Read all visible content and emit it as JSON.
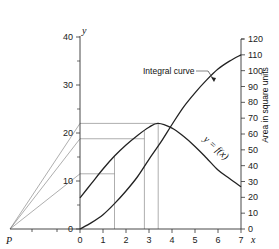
{
  "chart_data": {
    "type": "line",
    "title": "",
    "xlabel": "x",
    "ylabel_left": "y",
    "ylabel_right": "Area in square units",
    "x_ticks": [
      0,
      1,
      2,
      3,
      4,
      5,
      6,
      7
    ],
    "y_left_ticks": [
      0,
      10,
      20,
      30,
      40
    ],
    "y_right_ticks": [
      0,
      10,
      20,
      30,
      40,
      50,
      60,
      70,
      80,
      90,
      100,
      110,
      120
    ],
    "xlim": [
      0,
      7
    ],
    "ylim_left": [
      0,
      40
    ],
    "ylim_right": [
      0,
      120
    ],
    "pole_label": "P",
    "series": [
      {
        "name": "y = f(x)",
        "axis": "left",
        "x": [
          0,
          0.5,
          1,
          1.5,
          2,
          2.5,
          3,
          3.4,
          4,
          4.5,
          5,
          5.5,
          6,
          6.5,
          7
        ],
        "values": [
          6.5,
          9.5,
          12.5,
          15.2,
          17.5,
          19.5,
          21.2,
          22.0,
          21.0,
          19.3,
          17.2,
          14.8,
          12.3,
          10.5,
          8.8
        ]
      },
      {
        "name": "Integral curve",
        "axis": "right",
        "x": [
          0,
          0.5,
          1,
          1.5,
          2,
          2.5,
          3,
          3.5,
          4,
          4.5,
          5,
          5.5,
          6,
          6.5,
          7
        ],
        "values": [
          0,
          4,
          9,
          16,
          24,
          33,
          44,
          54.5,
          66,
          77,
          86,
          94,
          101,
          106,
          110
        ]
      }
    ],
    "construction": {
      "horizontal_levels_left": [
        22.0,
        18.8,
        11.5
      ],
      "vertical_lines_x": [
        1.5,
        2.8,
        3.4
      ]
    },
    "annotations": [
      {
        "text": "Integral curve",
        "x": 5.0,
        "y_right": 93
      },
      {
        "text": "y = f(x)",
        "x": 5.4,
        "y_left": 15
      }
    ]
  },
  "labels": {
    "y_axis": "y",
    "x_axis": "x",
    "right_axis": "Area in square units",
    "integral_curve": "Integral curve",
    "fx_label": "y = f(x)",
    "pole": "P"
  }
}
